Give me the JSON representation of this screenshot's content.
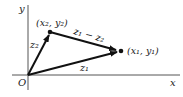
{
  "diagram": {
    "axes": {
      "x_label": "x",
      "y_label": "y",
      "origin_label": "O"
    },
    "points": {
      "p2": {
        "label": "(x₂, y₂)"
      },
      "p1": {
        "label": "(x₁, y₁)"
      }
    },
    "vectors": {
      "z2": {
        "label": "z₂"
      },
      "z1": {
        "label": "z₁"
      },
      "diff": {
        "label": "z₁ − z₂"
      }
    },
    "colors": {
      "vector": "#111111",
      "axis": "#555555",
      "text": "#222222"
    }
  }
}
